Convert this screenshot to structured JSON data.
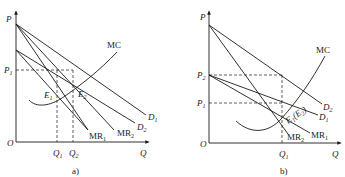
{
  "panels": [
    {
      "id": "a",
      "caption": "a)",
      "axes": {
        "y_label": "P",
        "x_label": "Q",
        "origin_label": "O"
      },
      "price_labels": {
        "p1": "P",
        "p1_sub": "1"
      },
      "quantity_labels": {
        "q1": "Q",
        "q1_sub": "1",
        "q2": "Q",
        "q2_sub": "2"
      },
      "curves": {
        "mc": "MC",
        "d1": "D",
        "d1_sub": "1",
        "d2": "D",
        "d2_sub": "2",
        "mr1": "MR",
        "mr1_sub": "1",
        "mr2": "MR",
        "mr2_sub": "2"
      },
      "points": {
        "e1": "E",
        "e1_sub": "1",
        "e2": "E",
        "e2_sub": "2"
      }
    },
    {
      "id": "b",
      "caption": "b)",
      "axes": {
        "y_label": "P",
        "x_label": "Q",
        "origin_label": "O"
      },
      "price_labels": {
        "p2": "P",
        "p2_sub": "2",
        "p1": "P",
        "p1_sub": "1"
      },
      "quantity_labels": {
        "q1": "Q",
        "q1_sub": "1"
      },
      "curves": {
        "mc": "MC",
        "d1": "D",
        "d1_sub": "1",
        "d2": "D",
        "d2_sub": "2",
        "mr1": "MR",
        "mr1_sub": "1",
        "mr2": "MR",
        "mr2_sub": "2"
      },
      "points": {
        "e": "E",
        "e_sub": "1",
        "e_paren": "(E",
        "e_paren_sub": "2",
        "e_close": ")"
      }
    }
  ],
  "colors": {
    "line": "#1a1a1a",
    "background": "#ffffff"
  }
}
